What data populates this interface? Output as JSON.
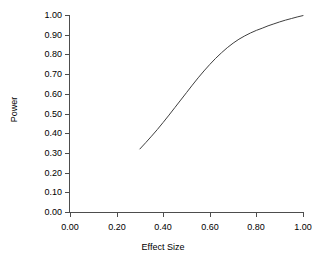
{
  "chart_data": {
    "type": "line",
    "title": "",
    "xlabel": "Effect Size",
    "ylabel": "Power",
    "xlim": [
      0.0,
      1.0
    ],
    "ylim": [
      0.0,
      1.0
    ],
    "grid": false,
    "legend": false,
    "line_color": "#3f3f3f",
    "background_color": "#ffffff",
    "axis_color": "#4d4d4d",
    "x_tick_labels": [
      "0.00",
      "0.20",
      "0.40",
      "0.60",
      "0.80",
      "1.00"
    ],
    "x_tick_values": [
      0.0,
      0.2,
      0.4,
      0.6,
      0.8,
      1.0
    ],
    "y_tick_labels": [
      "0.00",
      "0.10",
      "0.20",
      "0.30",
      "0.40",
      "0.50",
      "0.60",
      "0.70",
      "0.80",
      "0.90",
      "1.00"
    ],
    "y_tick_values": [
      0.0,
      0.1,
      0.2,
      0.3,
      0.4,
      0.5,
      0.6,
      0.7,
      0.8,
      0.9,
      1.0
    ],
    "series": [
      {
        "name": "Power curve",
        "x": [
          0.3,
          0.325,
          0.35,
          0.375,
          0.4,
          0.425,
          0.45,
          0.475,
          0.5,
          0.525,
          0.55,
          0.575,
          0.6,
          0.625,
          0.65,
          0.675,
          0.7,
          0.725,
          0.75,
          0.775,
          0.8,
          0.825,
          0.85,
          0.875,
          0.9,
          0.925,
          0.95,
          0.975,
          1.0
        ],
        "values": [
          0.32,
          0.352,
          0.385,
          0.419,
          0.455,
          0.492,
          0.53,
          0.568,
          0.606,
          0.644,
          0.681,
          0.716,
          0.749,
          0.78,
          0.808,
          0.834,
          0.857,
          0.877,
          0.894,
          0.909,
          0.922,
          0.933,
          0.945,
          0.955,
          0.965,
          0.974,
          0.982,
          0.99,
          0.997
        ]
      }
    ]
  }
}
